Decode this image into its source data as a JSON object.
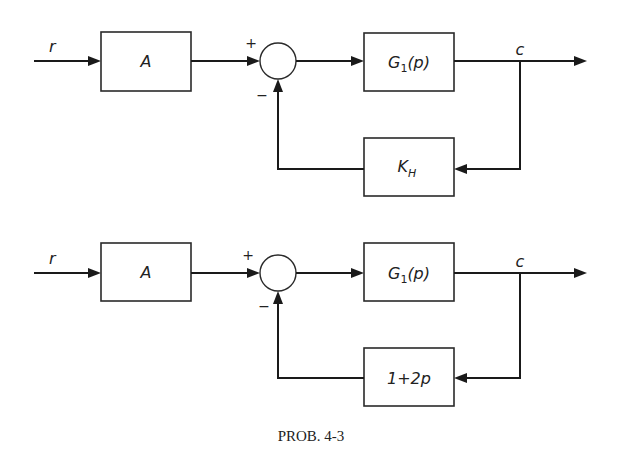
{
  "diagrams": [
    {
      "input_label": "r",
      "forward_block": "A",
      "plus_sign": "+",
      "minus_sign": "−",
      "plant_block_main": "G",
      "plant_block_sub": "1",
      "plant_block_arg": "(p)",
      "output_label": "c",
      "feedback_block_main": "K",
      "feedback_block_sub": "H"
    },
    {
      "input_label": "r",
      "forward_block": "A",
      "plus_sign": "+",
      "minus_sign": "−",
      "plant_block_main": "G",
      "plant_block_sub": "1",
      "plant_block_arg": "(p)",
      "output_label": "c",
      "feedback_block": "1+2p"
    }
  ],
  "caption": "PROB. 4-3",
  "colors": {
    "stroke": "#1a1a1a",
    "background": "#ffffff"
  }
}
